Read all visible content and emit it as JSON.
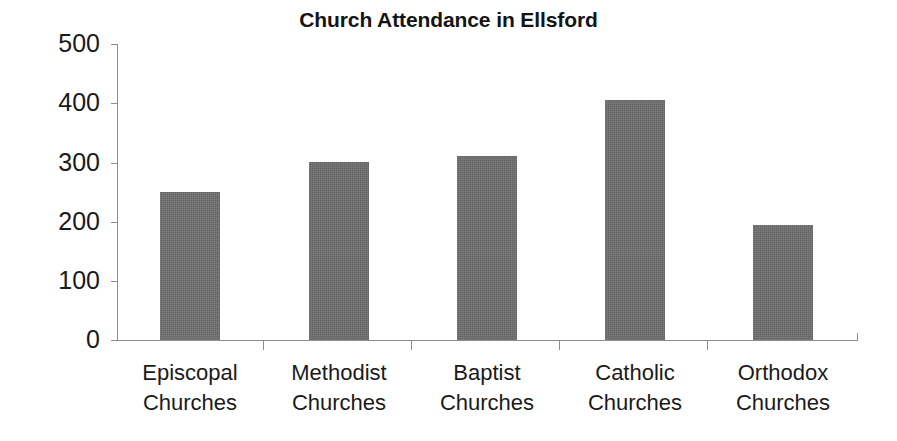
{
  "chart_data": {
    "type": "bar",
    "title": "Church Attendance in Ellsford",
    "subtitle": "",
    "xlabel": "",
    "ylabel": "",
    "categories": [
      "Episcopal Churches",
      "Methodist Churches",
      "Baptist Churches",
      "Catholic Churches",
      "Orthodox Churches"
    ],
    "category_lines": [
      [
        "Episcopal",
        "Churches"
      ],
      [
        "Methodist",
        "Churches"
      ],
      [
        "Baptist",
        "Churches"
      ],
      [
        "Catholic",
        "Churches"
      ],
      [
        "Orthodox",
        "Churches"
      ]
    ],
    "values": [
      250,
      300,
      310,
      405,
      195
    ],
    "ylim": [
      0,
      500
    ],
    "ytick_labels": [
      "500",
      "400",
      "300",
      "200",
      "100",
      "0"
    ],
    "ytick_values": [
      500,
      400,
      300,
      200,
      100,
      0
    ],
    "grid": false,
    "legend": false,
    "legend_position": "none",
    "bar_color": "#6e6e6e",
    "axis_color": "#8d8d8d",
    "text_color": "#1a1a1a",
    "background_color": "#ffffff"
  },
  "axis": {
    "y_labels": {
      "t500": "500",
      "t400": "400",
      "t300": "300",
      "t200": "200",
      "t100": "100",
      "t0": "0"
    }
  },
  "categories": {
    "c0": {
      "line1": "Episcopal",
      "line2": "Churches"
    },
    "c1": {
      "line1": "Methodist",
      "line2": "Churches"
    },
    "c2": {
      "line1": "Baptist",
      "line2": "Churches"
    },
    "c3": {
      "line1": "Catholic",
      "line2": "Churches"
    },
    "c4": {
      "line1": "Orthodox",
      "line2": "Churches"
    }
  }
}
